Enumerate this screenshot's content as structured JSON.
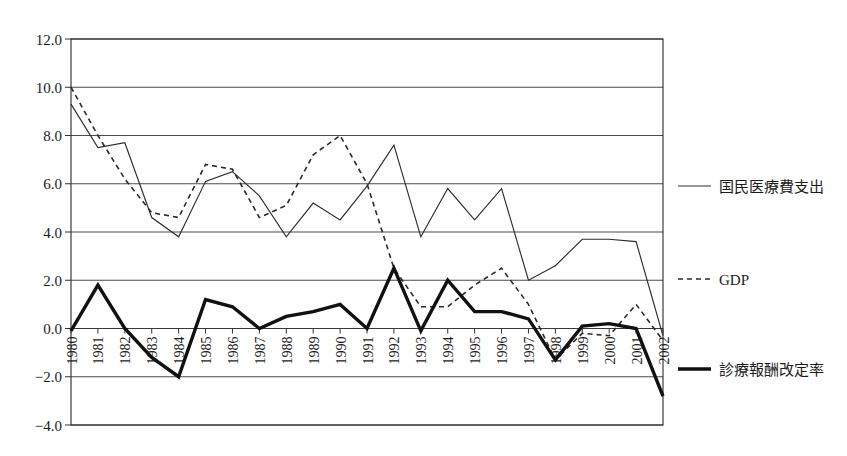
{
  "figure": {
    "scan_artifact_text": "· · · · · · · · · · · · · · · · · · · · · · · · · · · · ·"
  },
  "axes": {
    "y_ticks": [
      "12.0",
      "10.0",
      "8.0",
      "6.0",
      "4.0",
      "2.0",
      "0.0",
      "-2.0",
      "-4.0"
    ],
    "y_min": -4.0,
    "y_max": 12.0,
    "y_step": 2.0
  },
  "legend": {
    "items": [
      {
        "key": "medical",
        "label": "国民医療費支出",
        "style": "solid-thin"
      },
      {
        "key": "gdp",
        "label": "GDP",
        "style": "dashed"
      },
      {
        "key": "revision",
        "label": "診療報酬改定率",
        "style": "solid-thick"
      }
    ]
  },
  "chart_data": {
    "type": "line",
    "title": "",
    "xlabel": "",
    "ylabel": "",
    "ylim": [
      -4.0,
      12.0
    ],
    "ytick_step": 2.0,
    "grid": true,
    "legend_position": "right",
    "categories": [
      "1980",
      "1981",
      "1982",
      "1983",
      "1984",
      "1985",
      "1986",
      "1987",
      "1988",
      "1989",
      "1990",
      "1991",
      "1992",
      "1993",
      "1994",
      "1995",
      "1996",
      "1997",
      "1998",
      "1999",
      "2000",
      "2001",
      "2002"
    ],
    "series": [
      {
        "name": "国民医療費支出",
        "style": "solid-thin",
        "values": [
          9.3,
          7.5,
          7.7,
          4.6,
          3.8,
          6.1,
          6.5,
          5.5,
          3.8,
          5.2,
          4.5,
          5.9,
          7.6,
          3.8,
          5.8,
          4.5,
          5.8,
          2.0,
          2.6,
          3.7,
          3.7,
          3.6,
          -0.3
        ]
      },
      {
        "name": "GDP",
        "style": "dashed",
        "values": [
          10.0,
          8.0,
          6.2,
          4.8,
          4.6,
          6.8,
          6.6,
          4.6,
          5.1,
          7.2,
          8.0,
          6.0,
          2.5,
          0.9,
          0.9,
          1.8,
          2.5,
          1.0,
          -1.3,
          -0.2,
          -0.3,
          1.0,
          -0.5
        ]
      },
      {
        "name": "診療報酬改定率",
        "style": "solid-thick",
        "values": [
          -0.1,
          1.8,
          0.0,
          -1.2,
          -2.0,
          1.2,
          0.9,
          0.0,
          0.5,
          0.7,
          1.0,
          0.0,
          2.5,
          -0.1,
          2.0,
          0.7,
          0.7,
          0.4,
          -1.3,
          0.1,
          0.2,
          0.0,
          -2.8
        ]
      }
    ]
  }
}
